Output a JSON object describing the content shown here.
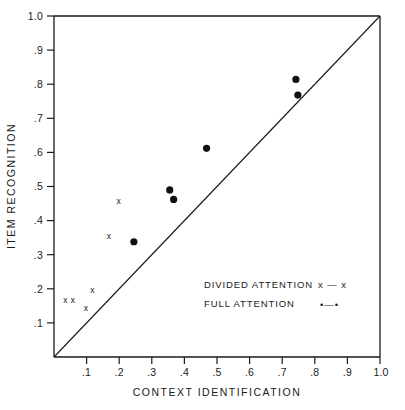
{
  "chart_data": {
    "type": "scatter",
    "title": "",
    "xlabel": "CONTEXT IDENTIFICATION",
    "ylabel": "ITEM RECOGNITION",
    "xlim": [
      0,
      1.0
    ],
    "ylim": [
      0,
      1.0
    ],
    "grid": false,
    "legend_position": "inside-lower-right",
    "xticks": [
      ".1",
      ".2",
      ".3",
      ".4",
      ".5",
      ".6",
      ".7",
      ".8",
      ".9",
      "1.0"
    ],
    "xtick_values": [
      0.1,
      0.2,
      0.3,
      0.4,
      0.5,
      0.6,
      0.7,
      0.8,
      0.9,
      1.0
    ],
    "yticks": [
      ".1",
      ".2",
      ".3",
      ".4",
      ".5",
      ".6",
      ".7",
      ".8",
      ".9",
      "1.0"
    ],
    "ytick_values": [
      0.1,
      0.2,
      0.3,
      0.4,
      0.5,
      0.6,
      0.7,
      0.8,
      0.9,
      1.0
    ],
    "reference_line": {
      "from": [
        0,
        0
      ],
      "to": [
        1.0,
        1.0
      ],
      "label": "diagonal identity line"
    },
    "series": [
      {
        "name": "DIVIDED ATTENTION",
        "marker": "x",
        "legend_marker": "x — x",
        "points": [
          {
            "x": 0.035,
            "y": 0.168
          },
          {
            "x": 0.058,
            "y": 0.168
          },
          {
            "x": 0.098,
            "y": 0.143
          },
          {
            "x": 0.118,
            "y": 0.196
          },
          {
            "x": 0.168,
            "y": 0.355
          },
          {
            "x": 0.198,
            "y": 0.457
          }
        ]
      },
      {
        "name": "FULL ATTENTION",
        "marker": "filled-circle",
        "legend_marker": "•—•",
        "points": [
          {
            "x": 0.245,
            "y": 0.338
          },
          {
            "x": 0.355,
            "y": 0.49
          },
          {
            "x": 0.367,
            "y": 0.462
          },
          {
            "x": 0.468,
            "y": 0.612
          },
          {
            "x": 0.742,
            "y": 0.814
          },
          {
            "x": 0.748,
            "y": 0.768
          }
        ]
      }
    ]
  },
  "legend": {
    "entries": [
      {
        "label": "DIVIDED ATTENTION",
        "marker": "x — x"
      },
      {
        "label": "FULL ATTENTION",
        "marker": "•—•"
      }
    ]
  }
}
